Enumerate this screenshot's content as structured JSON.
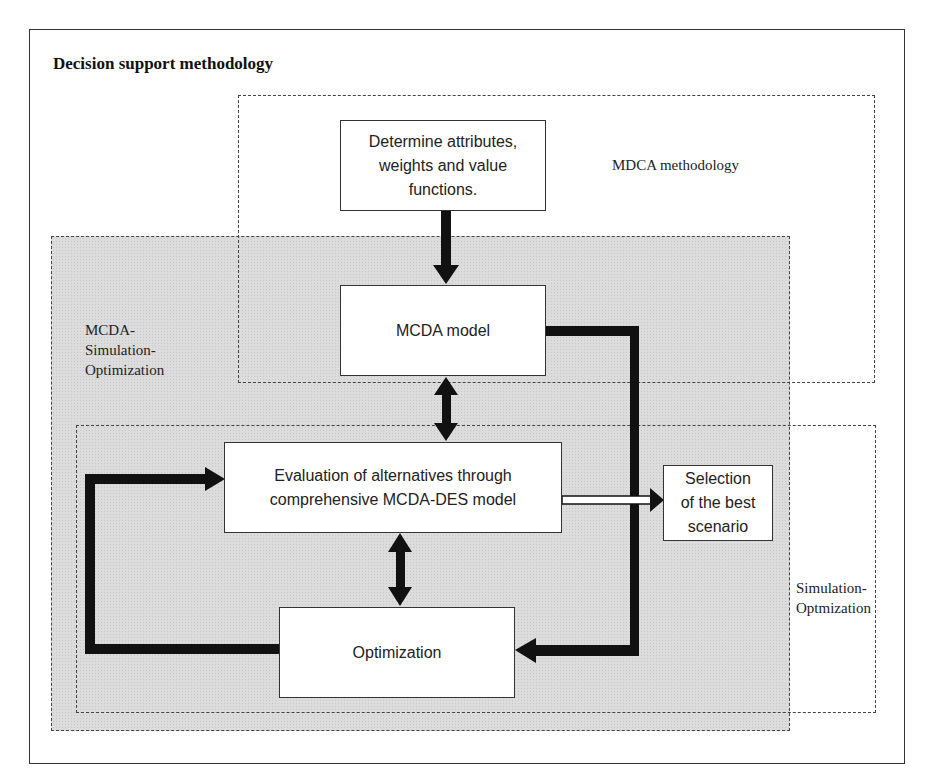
{
  "title": "Decision support methodology",
  "regions": {
    "mdca": {
      "label": "MDCA  methodology"
    },
    "mcda_sim_opt": {
      "label": "MCDA-\nSimulation-\nOptimization"
    },
    "sim_opt": {
      "label": "Simulation-\nOptmization"
    }
  },
  "boxes": {
    "determine": {
      "label": "Determine attributes,\nweights and value\nfunctions."
    },
    "mcda_model": {
      "label": "MCDA model"
    },
    "evaluation": {
      "label": "Evaluation of alternatives through\ncomprehensive MCDA-DES model"
    },
    "selection": {
      "label": "Selection\nof the best\nscenario"
    },
    "optimization": {
      "label": "Optimization"
    }
  },
  "colors": {
    "arrow": "#111111",
    "region_fill": "#dcdcdc",
    "border": "#333333"
  }
}
